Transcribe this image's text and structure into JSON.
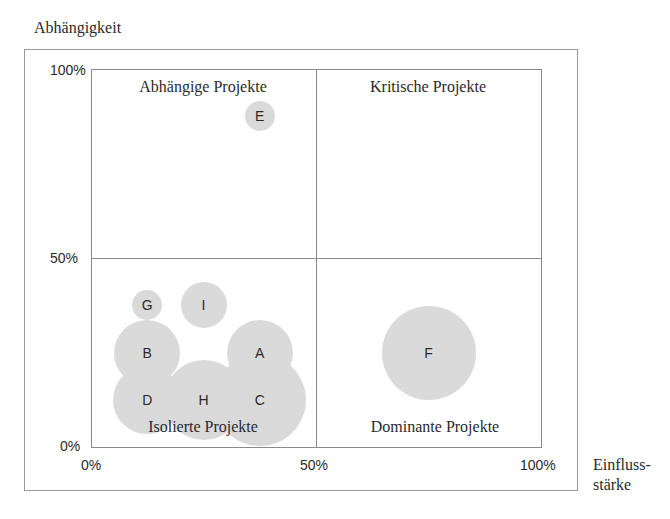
{
  "chart_data": {
    "type": "scatter",
    "subtype": "bubble-portfolio-matrix",
    "title": "",
    "xlabel": "Einfluss-stärke",
    "ylabel": "Abhängigkeit",
    "xlim": [
      0,
      100
    ],
    "ylim": [
      0,
      100
    ],
    "x_ticks": [
      "0%",
      "50%",
      "100%"
    ],
    "y_ticks": [
      "0%",
      "50%",
      "100%"
    ],
    "grid": "quadrant lines at 50%",
    "quadrants": [
      {
        "label": "Abhängige Projekte",
        "position": "top-left"
      },
      {
        "label": "Kritische Projekte",
        "position": "top-right"
      },
      {
        "label": "Isolierte Projekte",
        "position": "bottom-left"
      },
      {
        "label": "Dominante Projekte",
        "position": "bottom-right"
      }
    ],
    "points": [
      {
        "label": "E",
        "x": 37.5,
        "y": 87.5,
        "size": 15
      },
      {
        "label": "G",
        "x": 12.5,
        "y": 37.5,
        "size": 15
      },
      {
        "label": "I",
        "x": 25,
        "y": 37.5,
        "size": 23
      },
      {
        "label": "B",
        "x": 12.5,
        "y": 25,
        "size": 33
      },
      {
        "label": "A",
        "x": 37.5,
        "y": 25,
        "size": 33
      },
      {
        "label": "D",
        "x": 12.5,
        "y": 12.5,
        "size": 34
      },
      {
        "label": "H",
        "x": 25,
        "y": 12.5,
        "size": 40
      },
      {
        "label": "C",
        "x": 37.5,
        "y": 12.5,
        "size": 46
      },
      {
        "label": "F",
        "x": 75,
        "y": 25,
        "size": 47
      }
    ],
    "bubble_color": "#dadada"
  },
  "axes": {
    "ylabel": "Abhängigkeit",
    "xlabel_line1": "Einfluss-",
    "xlabel_line2": "stärke",
    "y_ticks": {
      "top": "100%",
      "mid": "50%",
      "bottom": "0%"
    },
    "x_ticks": {
      "left": "0%",
      "mid": "50%",
      "right": "100%"
    }
  },
  "quadrants": {
    "top_left": "Abhängige Projekte",
    "top_right": "Kritische Projekte",
    "bottom_left": "Isolierte Projekte",
    "bottom_right": "Dominante Projekte"
  }
}
